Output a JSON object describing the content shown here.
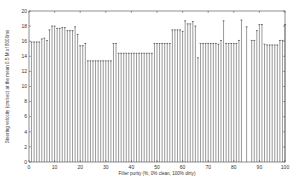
{
  "chart_data": {
    "type": "bar",
    "title": "",
    "xlabel": "Filter purity (%, 0% clean, 100% dirty)",
    "ylabel": "Steering velocity (cm/sec) at the mean 0.5 M of 8000ms",
    "xlim": [
      0,
      100
    ],
    "ylim": [
      0,
      20
    ],
    "xticks": [
      0,
      10,
      20,
      30,
      40,
      50,
      60,
      70,
      80,
      90,
      100
    ],
    "yticks": [
      0,
      2,
      4,
      6,
      8,
      10,
      12,
      14,
      16,
      18,
      20
    ],
    "grid": false,
    "legend": null,
    "bar_style": "stem with cap",
    "x": [
      1,
      2,
      3,
      4,
      5,
      6,
      7,
      8,
      9,
      10,
      11,
      12,
      13,
      14,
      15,
      16,
      17,
      18,
      19,
      20,
      21,
      22,
      23,
      24,
      25,
      26,
      27,
      28,
      29,
      30,
      31,
      32,
      33,
      34,
      35,
      36,
      37,
      38,
      39,
      40,
      41,
      42,
      43,
      44,
      45,
      46,
      47,
      48,
      49,
      50,
      51,
      52,
      53,
      54,
      55,
      56,
      57,
      58,
      59,
      60,
      61,
      62,
      63,
      64,
      65,
      66,
      67,
      68,
      69,
      70,
      71,
      72,
      73,
      74,
      75,
      76,
      77,
      78,
      79,
      80,
      81,
      82,
      83,
      85,
      87,
      88,
      89,
      90,
      91,
      92,
      93,
      94,
      95,
      96,
      97,
      98,
      99,
      100
    ],
    "values": [
      15.9,
      15.9,
      15.9,
      15.9,
      16.3,
      16.4,
      16.1,
      17.5,
      18.0,
      18.0,
      17.7,
      17.7,
      17.8,
      17.8,
      17.4,
      17.4,
      17.4,
      17.9,
      16.9,
      15.4,
      15.4,
      15.7,
      13.4,
      13.4,
      13.4,
      13.4,
      13.4,
      13.4,
      13.4,
      13.4,
      13.4,
      13.4,
      15.7,
      15.7,
      14.4,
      14.4,
      14.4,
      14.4,
      14.4,
      14.4,
      14.4,
      14.4,
      14.4,
      14.4,
      14.4,
      14.4,
      14.4,
      14.4,
      15.7,
      15.7,
      15.7,
      15.7,
      15.7,
      15.7,
      15.7,
      17.5,
      17.5,
      17.5,
      17.5,
      17.3,
      18.7,
      18.3,
      18.3,
      18.6,
      18.0,
      13.8,
      15.7,
      15.7,
      15.7,
      15.7,
      15.7,
      15.7,
      15.7,
      15.6,
      16.1,
      18.7,
      15.7,
      15.7,
      15.7,
      15.7,
      15.7,
      16.1,
      18.8,
      17.9,
      16.1,
      16.1,
      17.4,
      18.2,
      18.2,
      15.6,
      15.5,
      15.5,
      15.5,
      15.5,
      15.5,
      16.1,
      16.1,
      18.2
    ]
  }
}
